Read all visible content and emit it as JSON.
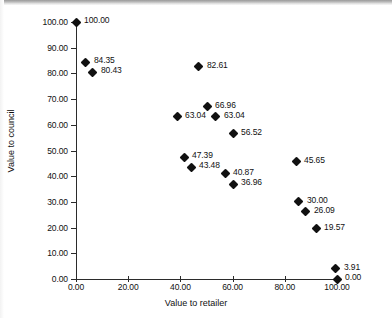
{
  "chart_data": {
    "type": "scatter",
    "title": "",
    "xlabel": "Value to retailer",
    "ylabel": "Value to council",
    "xlim": [
      0,
      100
    ],
    "ylim": [
      0,
      100
    ],
    "grid": false,
    "legend": null,
    "x_ticks": [
      "0.00",
      "20.00",
      "40.00",
      "60.00",
      "80.00",
      "100.00"
    ],
    "x_tick_values": [
      0,
      20,
      40,
      60,
      80,
      100
    ],
    "y_ticks": [
      "0.00",
      "10.00",
      "20.00",
      "30.00",
      "40.00",
      "50.00",
      "60.00",
      "70.00",
      "80.00",
      "90.00",
      "100.00"
    ],
    "y_tick_values": [
      0,
      10,
      20,
      30,
      40,
      50,
      60,
      70,
      80,
      90,
      100
    ],
    "points": [
      {
        "label": "100.00",
        "x": 0.0,
        "y": 100.0,
        "label_side": "right"
      },
      {
        "label": "84.35",
        "x": 3.8,
        "y": 84.35,
        "label_side": "right"
      },
      {
        "label": "80.43",
        "x": 6.5,
        "y": 80.43,
        "label_side": "right"
      },
      {
        "label": "82.61",
        "x": 47.1,
        "y": 82.61,
        "label_side": "right"
      },
      {
        "label": "66.96",
        "x": 50.2,
        "y": 66.96,
        "label_side": "right"
      },
      {
        "label": "63.04",
        "x": 38.7,
        "y": 63.04,
        "label_side": "right"
      },
      {
        "label": "63.04",
        "x": 53.6,
        "y": 63.04,
        "label_side": "right"
      },
      {
        "label": "56.52",
        "x": 60.2,
        "y": 56.52,
        "label_side": "right"
      },
      {
        "label": "47.39",
        "x": 41.4,
        "y": 47.39,
        "label_side": "right"
      },
      {
        "label": "43.48",
        "x": 44.1,
        "y": 43.48,
        "label_side": "right"
      },
      {
        "label": "40.87",
        "x": 57.1,
        "y": 40.87,
        "label_side": "right"
      },
      {
        "label": "36.96",
        "x": 60.2,
        "y": 36.96,
        "label_side": "right"
      },
      {
        "label": "45.65",
        "x": 84.3,
        "y": 45.65,
        "label_side": "right"
      },
      {
        "label": "30.00",
        "x": 85.4,
        "y": 30.0,
        "label_side": "right"
      },
      {
        "label": "26.09",
        "x": 88.1,
        "y": 26.09,
        "label_side": "right"
      },
      {
        "label": "19.57",
        "x": 92.0,
        "y": 19.57,
        "label_side": "right"
      },
      {
        "label": "3.91",
        "x": 99.6,
        "y": 3.91,
        "label_side": "right"
      },
      {
        "label": "0.00",
        "x": 100.0,
        "y": 0.0,
        "label_side": "right"
      }
    ]
  },
  "colors": {
    "marker": "#111111",
    "axis": "#2b2b2b",
    "text": "#111111",
    "background": "#ffffff"
  }
}
